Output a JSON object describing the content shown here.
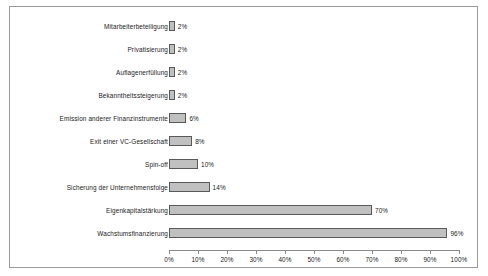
{
  "chart_data": {
    "type": "bar",
    "orientation": "horizontal",
    "title": "",
    "xlabel": "",
    "ylabel": "",
    "xlim": [
      0,
      100
    ],
    "grid": false,
    "legend": null,
    "categories": [
      "Mitarbeiterbeteiligung",
      "Privatisierung",
      "Auflagenerfüllung",
      "Bekanntheitssteigerung",
      "Emission anderer Finanzinstrumente",
      "Exit einer VC-Gesellschaft",
      "Spin-off",
      "Sicherung der Unternehmensfolge",
      "Eigenkapitalstärkung",
      "Wachstumsfinanzierung"
    ],
    "values": [
      2,
      2,
      2,
      2,
      6,
      8,
      10,
      14,
      70,
      96
    ],
    "value_labels": [
      "2%",
      "2%",
      "2%",
      "2%",
      "6%",
      "8%",
      "10%",
      "14%",
      "70%",
      "96%"
    ],
    "x_ticks": [
      0,
      10,
      20,
      30,
      40,
      50,
      60,
      70,
      80,
      90,
      100
    ],
    "x_tick_labels": [
      "0%",
      "10%",
      "20%",
      "30%",
      "40%",
      "50%",
      "60%",
      "70%",
      "80%",
      "90%",
      "100%"
    ],
    "colors": {
      "bar_fill": "#c0c0c0",
      "bar_border": "#595959",
      "axis": "#8a8a8a",
      "frame": "#9a9a9a",
      "text": "#1a1a1a",
      "background": "#ffffff"
    }
  }
}
